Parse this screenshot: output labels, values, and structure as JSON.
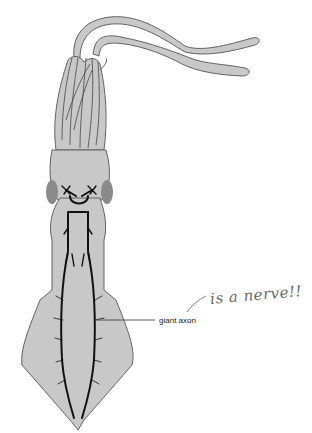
{
  "figure": {
    "labels": {
      "axon": "giant axon"
    },
    "annotation": {
      "handwritten": "is a nerve!!"
    },
    "colors": {
      "body_fill": "#c8c8c8",
      "outline": "#555555",
      "nerve": "#111111",
      "eye": "#8a8a8a",
      "annotation_ink": "#666666"
    }
  }
}
